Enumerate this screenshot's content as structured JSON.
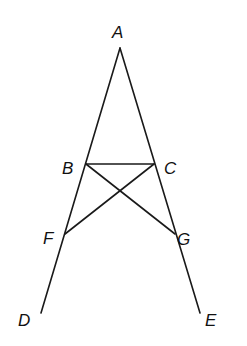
{
  "diagram": {
    "type": "geometry-figure",
    "points": {
      "A": {
        "label": "A",
        "x": 120,
        "y": 48,
        "lx": 112,
        "ly": 38
      },
      "B": {
        "label": "B",
        "x": 86,
        "y": 164,
        "lx": 62,
        "ly": 174
      },
      "C": {
        "label": "C",
        "x": 154,
        "y": 164,
        "lx": 164,
        "ly": 174
      },
      "F": {
        "label": "F",
        "x": 65,
        "y": 234,
        "lx": 43,
        "ly": 244
      },
      "G": {
        "label": "G",
        "x": 175,
        "y": 234,
        "lx": 177,
        "ly": 245
      },
      "D": {
        "label": "D",
        "x": 41,
        "y": 313,
        "lx": 18,
        "ly": 326
      },
      "E": {
        "label": "E",
        "x": 200,
        "y": 313,
        "lx": 205,
        "ly": 326
      }
    },
    "segments": [
      {
        "name": "AD",
        "from": "A",
        "to": "D"
      },
      {
        "name": "AE",
        "from": "A",
        "to": "E"
      },
      {
        "name": "BC",
        "from": "B",
        "to": "C"
      },
      {
        "name": "BG",
        "from": "B",
        "to": "G"
      },
      {
        "name": "CF",
        "from": "C",
        "to": "F"
      }
    ],
    "stroke_color": "#1a1a1a",
    "background": "#ffffff"
  }
}
